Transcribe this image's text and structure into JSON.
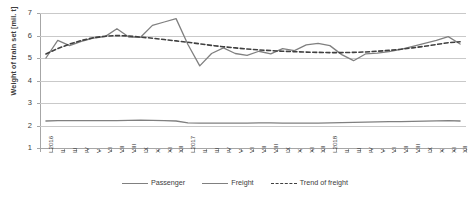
{
  "chart_data": {
    "type": "line",
    "title": "",
    "xlabel": "",
    "ylabel": "Weight of train set [mil. t]",
    "ylim": [
      1,
      7
    ],
    "yticks": [
      1,
      2,
      3,
      4,
      5,
      6,
      7
    ],
    "grid": true,
    "legend_position": "bottom",
    "categories": [
      "I 2016",
      "II",
      "III",
      "IV",
      "V",
      "VI",
      "VII",
      "VIII",
      "IX",
      "X",
      "XI",
      "XII",
      "I 2017",
      "II",
      "III",
      "IV",
      "V",
      "VI",
      "VII",
      "VIII",
      "IX",
      "X",
      "XI",
      "XII",
      "I 2018",
      "II",
      "III",
      "IV",
      "V",
      "VI",
      "VII",
      "VIII",
      "IX",
      "X",
      "XI",
      "XII"
    ],
    "series": [
      {
        "name": "Passenger",
        "color": "#808080",
        "style": "solid",
        "values": [
          2.2,
          2.22,
          2.22,
          2.22,
          2.22,
          2.22,
          2.22,
          2.23,
          2.24,
          2.23,
          2.22,
          2.2,
          2.12,
          2.11,
          2.11,
          2.11,
          2.11,
          2.11,
          2.12,
          2.12,
          2.11,
          2.11,
          2.11,
          2.11,
          2.12,
          2.13,
          2.14,
          2.15,
          2.16,
          2.17,
          2.17,
          2.18,
          2.19,
          2.21,
          2.22,
          2.2
        ]
      },
      {
        "name": "Freight",
        "color": "#808080",
        "style": "solid",
        "values": [
          5.0,
          5.78,
          5.55,
          5.74,
          5.88,
          5.95,
          6.3,
          5.93,
          5.92,
          6.45,
          6.6,
          6.75,
          5.6,
          4.65,
          5.2,
          5.45,
          5.2,
          5.12,
          5.3,
          5.18,
          5.42,
          5.33,
          5.58,
          5.65,
          5.55,
          5.15,
          4.88,
          5.18,
          5.22,
          5.28,
          5.38,
          5.52,
          5.65,
          5.78,
          5.95,
          5.62
        ]
      },
      {
        "name": "Trend of freight",
        "color": "#404040",
        "style": "dashed",
        "values": [
          5.18,
          5.42,
          5.62,
          5.78,
          5.9,
          5.97,
          6.0,
          5.98,
          5.93,
          5.88,
          5.82,
          5.76,
          5.7,
          5.63,
          5.56,
          5.5,
          5.45,
          5.4,
          5.36,
          5.33,
          5.3,
          5.28,
          5.26,
          5.25,
          5.24,
          5.24,
          5.25,
          5.27,
          5.3,
          5.34,
          5.39,
          5.45,
          5.52,
          5.6,
          5.68,
          5.72
        ]
      }
    ],
    "legend": [
      "Passenger",
      "Freight",
      "Trend of freight"
    ]
  }
}
